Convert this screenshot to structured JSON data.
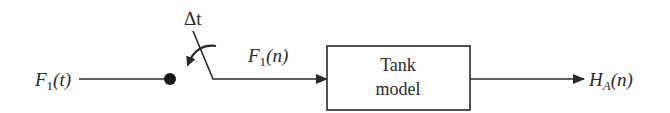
{
  "diagram": {
    "type": "block-diagram",
    "input": {
      "symbol": "F",
      "subscript": "1",
      "arg": "(t)"
    },
    "sampler": {
      "label": "Δt"
    },
    "sampled": {
      "symbol": "F",
      "subscript": "1",
      "arg": "(n)"
    },
    "block": {
      "line1": "Tank",
      "line2": "model"
    },
    "output": {
      "symbol": "H",
      "subscript": "A",
      "arg": "(n)"
    },
    "colors": {
      "stroke": "#2a2a2a",
      "background": "#ffffff"
    }
  }
}
